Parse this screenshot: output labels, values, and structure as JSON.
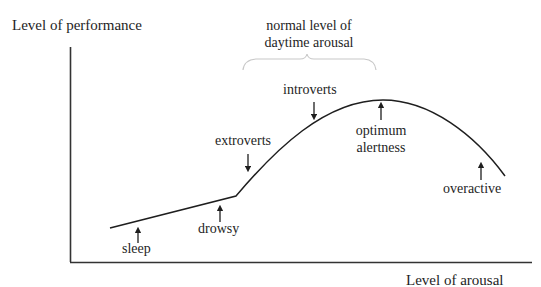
{
  "diagram": {
    "y_axis_label": "Level of performance",
    "x_axis_label": "Level of arousal",
    "brace_label_line1": "normal level of",
    "brace_label_line2": "daytime arousal",
    "annotations": {
      "sleep": "sleep",
      "drowsy": "drowsy",
      "extroverts": "extroverts",
      "introverts": "introverts",
      "optimum_line1": "optimum",
      "optimum_line2": "alertness",
      "overactive": "overactive"
    },
    "colors": {
      "ink": "#1e1e1e",
      "axis": "#333333",
      "brace": "#c8c8c8"
    }
  }
}
